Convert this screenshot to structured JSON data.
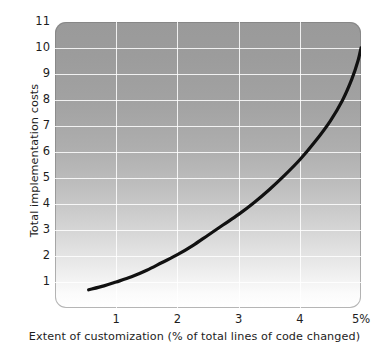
{
  "chart_data": {
    "type": "line",
    "title": "",
    "xlabel": "Extent of customization (% of total lines of code changed)",
    "ylabel": "Total implementation costs",
    "xlim": [
      0,
      5
    ],
    "ylim": [
      0,
      11
    ],
    "grid": true,
    "legend": null,
    "x_tick_labels": [
      "1",
      "2",
      "3",
      "4",
      "5%"
    ],
    "x_tick_values": [
      1,
      2,
      3,
      4,
      5
    ],
    "y_tick_labels": [
      "1",
      "2",
      "3",
      "4",
      "5",
      "6",
      "7",
      "8",
      "9",
      "10",
      "11"
    ],
    "y_tick_values": [
      1,
      2,
      3,
      4,
      5,
      6,
      7,
      8,
      9,
      10,
      11
    ],
    "series": [
      {
        "name": "Total implementation costs",
        "color": "#111111",
        "x": [
          0.55,
          0.8,
          1.0,
          1.25,
          1.5,
          1.75,
          2.0,
          2.25,
          2.5,
          2.75,
          3.0,
          3.25,
          3.5,
          3.75,
          4.0,
          4.25,
          4.5,
          4.7,
          4.85,
          4.95,
          5.0
        ],
        "values": [
          0.7,
          0.85,
          1.0,
          1.2,
          1.45,
          1.75,
          2.05,
          2.4,
          2.8,
          3.2,
          3.6,
          4.05,
          4.55,
          5.1,
          5.7,
          6.4,
          7.2,
          8.0,
          8.8,
          9.5,
          10.0
        ]
      }
    ],
    "background": {
      "top_color": "#9a9a9a",
      "bottom_color": "#ffffff",
      "gridline_color": "#ffffff"
    }
  }
}
